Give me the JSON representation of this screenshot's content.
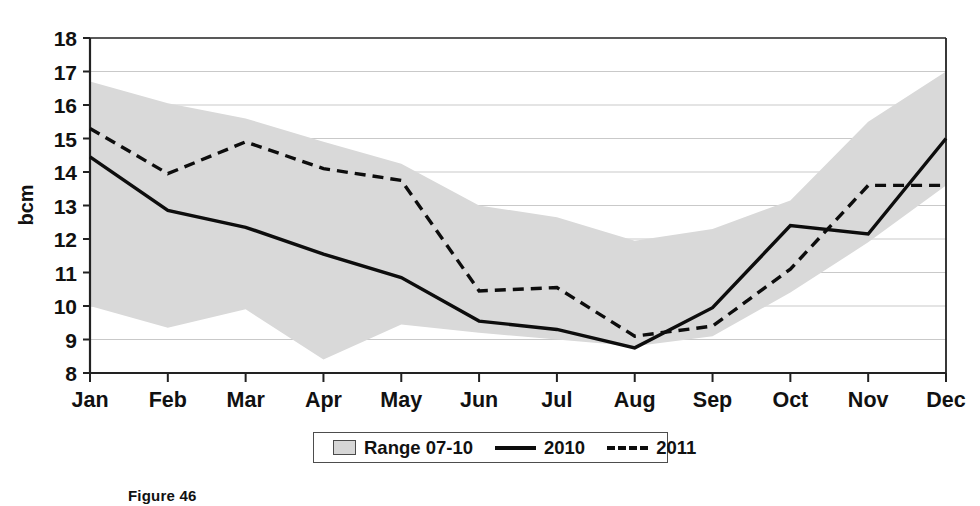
{
  "figure": {
    "caption": "Figure 46"
  },
  "axes": {
    "y_title": "bcm",
    "y_ticks": [
      "8",
      "9",
      "10",
      "11",
      "12",
      "13",
      "14",
      "15",
      "16",
      "17",
      "18"
    ],
    "x_ticks": [
      "Jan",
      "Feb",
      "Mar",
      "Apr",
      "May",
      "Jun",
      "Jul",
      "Aug",
      "Sep",
      "Oct",
      "Nov",
      "Dec"
    ]
  },
  "legend": {
    "items": [
      {
        "label": "Range 07-10",
        "marker": "range-swatch-icon"
      },
      {
        "label": "2010",
        "marker": "solid-line-icon"
      },
      {
        "label": "2011",
        "marker": "dashed-line-icon"
      }
    ]
  },
  "colors": {
    "range_fill": "#d9d9d9",
    "line_2010": "#0d0d0d",
    "line_2011": "#0d0d0d",
    "gridline": "#c9c9c9",
    "axis": "#222222",
    "background": "#ffffff"
  },
  "chart_data": {
    "type": "line",
    "title": "",
    "subtitle": "",
    "xlabel": "",
    "ylabel": "bcm",
    "ylim": [
      8,
      18
    ],
    "ytick_step": 1,
    "grid": true,
    "legend_position": "bottom",
    "categories": [
      "Jan",
      "Feb",
      "Mar",
      "Apr",
      "May",
      "Jun",
      "Jul",
      "Aug",
      "Sep",
      "Oct",
      "Nov",
      "Dec"
    ],
    "band": {
      "name": "Range 07-10",
      "style": "filled-area",
      "lower": [
        10.0,
        9.35,
        9.9,
        8.4,
        9.45,
        9.2,
        9.0,
        8.8,
        9.1,
        10.4,
        11.9,
        13.6
      ],
      "upper": [
        16.7,
        16.05,
        15.6,
        14.9,
        14.25,
        13.0,
        12.65,
        11.95,
        12.3,
        13.15,
        15.5,
        17.0
      ]
    },
    "series": [
      {
        "name": "2010",
        "style": "solid",
        "values": [
          14.45,
          12.85,
          12.35,
          11.55,
          10.85,
          9.55,
          9.3,
          8.75,
          9.95,
          12.4,
          12.15,
          15.0
        ]
      },
      {
        "name": "2011",
        "style": "dashed",
        "values": [
          15.3,
          13.95,
          14.9,
          14.1,
          13.75,
          10.45,
          10.55,
          9.1,
          9.4,
          11.1,
          13.6,
          13.6
        ]
      }
    ]
  }
}
